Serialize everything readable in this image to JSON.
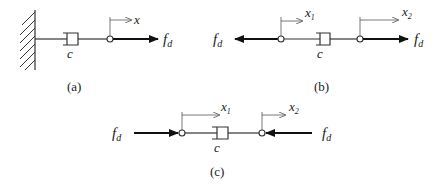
{
  "figure": {
    "panels": [
      {
        "id": "a",
        "caption": "(a)",
        "damper_label": "c",
        "displacement_labels": [
          "x"
        ],
        "force_labels": [
          "f",
          "d"
        ],
        "description": "Damper fixed to wall, force f_d applied at free node pulling right"
      },
      {
        "id": "b",
        "caption": "(b)",
        "damper_label": "c",
        "displacement_labels": [
          "x",
          "1",
          "x",
          "2"
        ],
        "force_labels_left": [
          "f",
          "d"
        ],
        "force_labels_right": [
          "f",
          "d"
        ],
        "description": "Free damper with forces f_d pulling outward at both nodes"
      },
      {
        "id": "c",
        "caption": "(c)",
        "damper_label": "c",
        "displacement_labels": [
          "x",
          "1",
          "x",
          "2"
        ],
        "force_labels_left": [
          "f",
          "d"
        ],
        "force_labels_right": [
          "f",
          "d"
        ],
        "description": "Free damper with forces f_d pushing inward at both nodes"
      }
    ],
    "colors": {
      "stroke": "#333333",
      "force": "#111111",
      "background": "#ffffff"
    }
  }
}
